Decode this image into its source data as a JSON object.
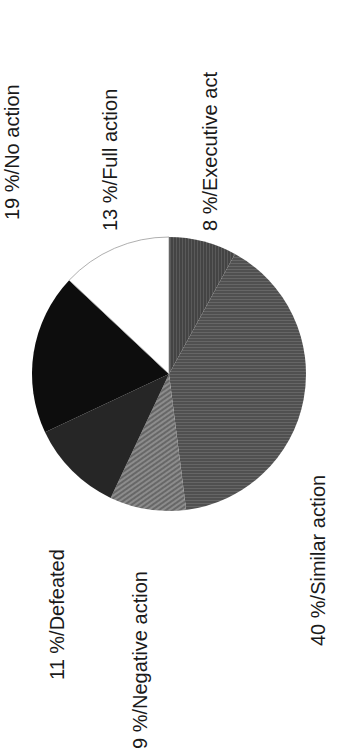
{
  "chart_data": {
    "type": "pie",
    "title": "",
    "orientation": "rotated -90deg (labels read bottom-to-top)",
    "start_angle_deg": 0,
    "direction": "clockwise",
    "slices": [
      {
        "name": "Executive act",
        "value": 8,
        "label": "8 %/Executive act",
        "fill": "#4a4a4a",
        "pattern": "vertical-lines"
      },
      {
        "name": "Similar action",
        "value": 40,
        "label": "40 %/Similar action",
        "fill": "#555555",
        "pattern": "horizontal-lines"
      },
      {
        "name": "Negative action",
        "value": 9,
        "label": "9 %/Negative action",
        "fill": "#7a7a7a",
        "pattern": "diagonal-lines"
      },
      {
        "name": "Defeated",
        "value": 11,
        "label": "11 %/Defeated",
        "fill": "#262626",
        "pattern": "solid"
      },
      {
        "name": "No action",
        "value": 19,
        "label": "19 %/No action",
        "fill": "#0d0d0d",
        "pattern": "solid"
      },
      {
        "name": "Full action",
        "value": 13,
        "label": "13 %/Full action",
        "fill": "#ffffff",
        "pattern": "solid"
      }
    ],
    "categories": [
      "Executive act",
      "Similar action",
      "Negative action",
      "Defeated",
      "No action",
      "Full action"
    ],
    "values": [
      8,
      40,
      9,
      11,
      19,
      13
    ],
    "unit": "%",
    "legend": "none (inline labels)"
  },
  "labels": {
    "no_action": "19 %/No action",
    "full_action": "13 %/Full action",
    "executive_act": "8 %/Executive act",
    "defeated": "11 %/Defeated",
    "negative_action": "9 %/Negative action",
    "similar_action": "40 %/Similar action"
  },
  "geometry": {
    "cx": 169,
    "cy": 374,
    "r": 137
  }
}
